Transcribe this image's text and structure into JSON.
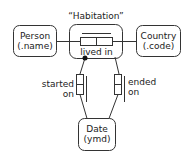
{
  "title": "“Habitation”",
  "entities": {
    "person": {
      "line1": "Person",
      "line2": "(.name)"
    },
    "country": {
      "line1": "Country",
      "line2": "(.code)"
    },
    "date": {
      "line1": "Date",
      "line2": "(ymd)"
    }
  },
  "relation": {
    "label": "lived in"
  },
  "roles": {
    "started": {
      "line1": "started",
      "line2": "on"
    },
    "ended": {
      "line1": "ended",
      "line2": "on"
    }
  },
  "colors": {
    "stroke": "#333333",
    "background": "#ffffff"
  }
}
